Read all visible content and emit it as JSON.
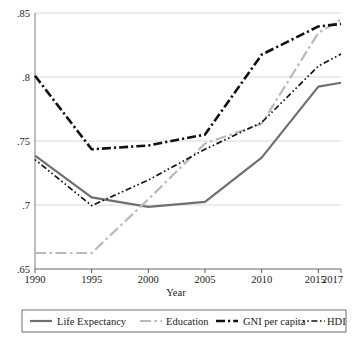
{
  "chart_data": {
    "type": "line",
    "title": "",
    "xlabel": "Year",
    "ylabel": "",
    "x": [
      1990,
      1995,
      2000,
      2005,
      2010,
      2015,
      2017
    ],
    "xtick_labels": [
      "1990",
      "1995",
      "2000",
      "2005",
      "2010",
      "2015",
      "2017"
    ],
    "ytick_labels": [
      ".65",
      ".7",
      ".75",
      ".8",
      ".85"
    ],
    "ytick_values": [
      0.65,
      0.7,
      0.75,
      0.8,
      0.85
    ],
    "ylim": [
      0.65,
      0.85
    ],
    "xlim": [
      1990,
      2017
    ],
    "grid": "horizontal",
    "legend_position": "bottom",
    "series": [
      {
        "name": "Life Expectancy",
        "color": "#6f6f6f",
        "style": "solid",
        "width": 2.2,
        "values": [
          0.7385,
          0.706,
          0.6985,
          0.7025,
          0.737,
          0.7925,
          0.7955
        ]
      },
      {
        "name": "Education",
        "color": "#b9b9b9",
        "style": "dash-dot",
        "width": 2.2,
        "values": [
          0.6625,
          0.6625,
          0.7045,
          0.748,
          0.7635,
          0.8345,
          0.845
        ]
      },
      {
        "name": "GNI per capita",
        "color": "#111111",
        "style": "dash-dot-thick",
        "width": 2.6,
        "values": [
          0.801,
          0.7435,
          0.7465,
          0.755,
          0.8175,
          0.8395,
          0.8415
        ]
      },
      {
        "name": "HDI",
        "color": "#111111",
        "style": "dot-dash-fine",
        "width": 1.7,
        "values": [
          0.7355,
          0.6995,
          0.7195,
          0.7435,
          0.7645,
          0.8085,
          0.818
        ]
      }
    ]
  },
  "legend": {
    "entries": [
      {
        "label": "Life Expectancy"
      },
      {
        "label": "Education"
      },
      {
        "label": "GNI per capita"
      },
      {
        "label": "HDI"
      }
    ]
  },
  "axes": {
    "x_title": "Year"
  }
}
